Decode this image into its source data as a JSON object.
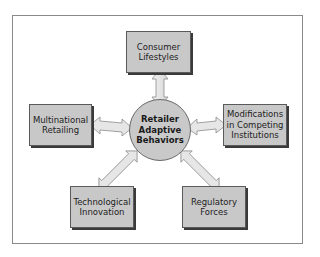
{
  "diagram": {
    "type": "hub-and-spoke",
    "center": {
      "label": "Retailer\nAdaptive\nBehaviors"
    },
    "nodes": [
      {
        "id": "consumer-lifestyles",
        "label": "Consumer\nLifestyles",
        "position": "top"
      },
      {
        "id": "multinational-retailing",
        "label": "Multinational\nRetailing",
        "position": "left"
      },
      {
        "id": "modifications-competing",
        "label": "Modifications\nin Competing\nInstitutions",
        "position": "right"
      },
      {
        "id": "technological-innovation",
        "label": "Technological\nInnovation",
        "position": "bottom-left"
      },
      {
        "id": "regulatory-forces",
        "label": "Regulatory\nForces",
        "position": "bottom-right"
      }
    ],
    "edges": [
      {
        "from": "center",
        "to": "consumer-lifestyles",
        "style": "double-arrow"
      },
      {
        "from": "center",
        "to": "multinational-retailing",
        "style": "double-arrow"
      },
      {
        "from": "center",
        "to": "modifications-competing",
        "style": "double-arrow"
      },
      {
        "from": "center",
        "to": "technological-innovation",
        "style": "double-arrow"
      },
      {
        "from": "center",
        "to": "regulatory-forces",
        "style": "double-arrow"
      }
    ],
    "colors": {
      "box_fill": "#c8c8c8",
      "box_border": "#5a5a5a",
      "box_shadow": "#3a3a3a",
      "circle_fill": "#c9c9c9",
      "arrow_fill": "#e6e6e6",
      "arrow_stroke": "#8c8c8c",
      "frame_border": "#8a8a8a"
    }
  }
}
